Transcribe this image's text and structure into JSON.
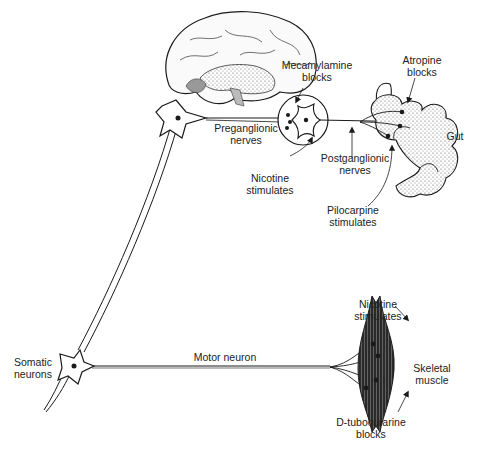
{
  "diagram": {
    "colors": {
      "line": "#1a1a1a",
      "stipple": "#555555",
      "background": "#ffffff"
    },
    "labels": {
      "mecamylamine": [
        "Mecamylamine",
        "blocks"
      ],
      "atropine": [
        "Atropine",
        "blocks"
      ],
      "gut": "Gut",
      "preganglionic": [
        "Preganglionic",
        "nerves"
      ],
      "postganglionic": [
        "Postganglionic",
        "nerves"
      ],
      "nicotine_ganglion": [
        "Nicotine",
        "stimulates"
      ],
      "pilocarpine": [
        "Pilocarpine",
        "stimulates"
      ],
      "somatic": [
        "Somatic",
        "neurons"
      ],
      "motor_neuron": "Motor neuron",
      "nicotine_muscle": [
        "Nicotine",
        "stimulates"
      ],
      "skeletal_muscle": [
        "Skeletal",
        "muscle"
      ],
      "tubocurarine": [
        "D-tubocurarine",
        "blocks"
      ]
    },
    "icons": [
      "brain-illustration",
      "neuron-cell-icon",
      "ganglion-circle-icon",
      "gut-illustration",
      "skeletal-muscle-icon",
      "arrow-icon"
    ]
  }
}
